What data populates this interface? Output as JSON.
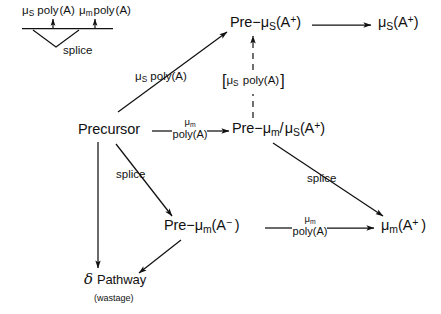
{
  "figure": {
    "background_color": "#ffffff",
    "line_color": "#111111"
  },
  "inset": {
    "name": "splice-site-map",
    "left_poly_a_label": "μS poly(A)",
    "right_poly_a_label": "μm poly(A)",
    "splice_label": "splice"
  },
  "nodes": [
    {
      "id": "precursor",
      "label": "Precursor"
    },
    {
      "id": "pre-mu-s",
      "label_parts": {
        "prefix": "Pre−μ",
        "sub": "S",
        "suffix": "(A⁺)"
      },
      "label": "Pre−μS(A⁺)"
    },
    {
      "id": "mu-s",
      "label_parts": {
        "prefix": "μ",
        "sub": "S",
        "suffix": "(A⁺)"
      },
      "label": "μS(A⁺)"
    },
    {
      "id": "pre-mu-m-mu-s",
      "label": "Pre−μm/ μS(A⁺)"
    },
    {
      "id": "pre-mu-m-minus",
      "label": "Pre−μm(A⁻ )"
    },
    {
      "id": "mu-m",
      "label": "μm(A⁺ )"
    },
    {
      "id": "delta-pathway",
      "label": "Pathway",
      "glyph": "δ",
      "sublabel": "(wastage)"
    }
  ],
  "edge_labels": [
    {
      "id": "mu-s-poly-a-diagonal",
      "text": "μS poly(A)"
    },
    {
      "id": "mu-m-poly-a-precursor",
      "line1": "μm",
      "line2": "poly(A)"
    },
    {
      "id": "splice-precursor-lower",
      "text": "splice"
    },
    {
      "id": "splice-right",
      "text": "splice"
    },
    {
      "id": "mu-m-poly-a-lower",
      "line1": "μm",
      "line2": "poly(A)"
    },
    {
      "id": "bracket-mu-s-poly-a",
      "text": "[μS  poly(A) ]"
    }
  ]
}
